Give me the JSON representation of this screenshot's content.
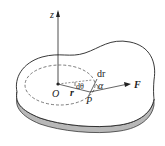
{
  "diagram": {
    "labels": {
      "z_axis": "z",
      "origin": "O",
      "radius": "r",
      "dtheta": "dθ",
      "point": "P",
      "dr": "dr",
      "alpha": "α",
      "force": "F"
    },
    "colors": {
      "outline": "#222222",
      "slab_side": "#b8b8b8",
      "background": "#ffffff"
    }
  }
}
